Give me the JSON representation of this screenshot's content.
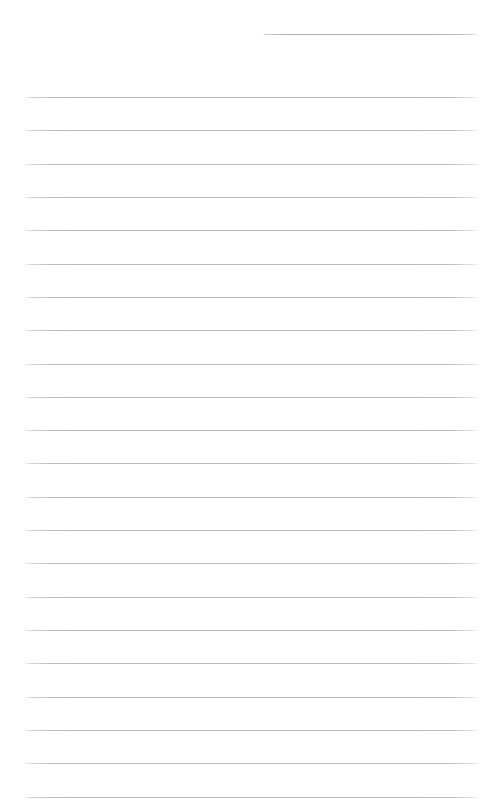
{
  "document": {
    "kind": "ruled-paper-sheet",
    "title": "",
    "body_text": "",
    "is_blank": true,
    "page_width": 502,
    "page_height": 808,
    "background_color": "#ffffff",
    "rule_color": "#b9b9bd",
    "header_rule_color": "#b2b2b7",
    "rule_thickness": 1,
    "rule_spacing": 33.3,
    "left_margin": 23,
    "right_margin": 479
  },
  "header_rule": {
    "name": "title-rule",
    "x": 262,
    "width": 216,
    "y": 34
  },
  "rules": [
    {
      "y": 97,
      "x": 23,
      "width": 456
    },
    {
      "y": 130,
      "x": 23,
      "width": 456
    },
    {
      "y": 164,
      "x": 23,
      "width": 456
    },
    {
      "y": 197,
      "x": 23,
      "width": 456
    },
    {
      "y": 230,
      "x": 23,
      "width": 456
    },
    {
      "y": 264,
      "x": 23,
      "width": 456
    },
    {
      "y": 297,
      "x": 23,
      "width": 456
    },
    {
      "y": 330,
      "x": 23,
      "width": 456
    },
    {
      "y": 364,
      "x": 23,
      "width": 456
    },
    {
      "y": 397,
      "x": 23,
      "width": 456
    },
    {
      "y": 430,
      "x": 23,
      "width": 456
    },
    {
      "y": 463,
      "x": 23,
      "width": 456
    },
    {
      "y": 497,
      "x": 23,
      "width": 456
    },
    {
      "y": 530,
      "x": 23,
      "width": 456
    },
    {
      "y": 563,
      "x": 23,
      "width": 456
    },
    {
      "y": 597,
      "x": 23,
      "width": 456
    },
    {
      "y": 630,
      "x": 23,
      "width": 456
    },
    {
      "y": 663,
      "x": 23,
      "width": 456
    },
    {
      "y": 697,
      "x": 23,
      "width": 456
    },
    {
      "y": 730,
      "x": 23,
      "width": 456
    },
    {
      "y": 763,
      "x": 23,
      "width": 456
    },
    {
      "y": 797,
      "x": 23,
      "width": 456
    }
  ],
  "line_entries": [
    {
      "index": 1,
      "text": ""
    },
    {
      "index": 2,
      "text": ""
    },
    {
      "index": 3,
      "text": ""
    },
    {
      "index": 4,
      "text": ""
    },
    {
      "index": 5,
      "text": ""
    },
    {
      "index": 6,
      "text": ""
    },
    {
      "index": 7,
      "text": ""
    },
    {
      "index": 8,
      "text": ""
    },
    {
      "index": 9,
      "text": ""
    },
    {
      "index": 10,
      "text": ""
    },
    {
      "index": 11,
      "text": ""
    },
    {
      "index": 12,
      "text": ""
    },
    {
      "index": 13,
      "text": ""
    },
    {
      "index": 14,
      "text": ""
    },
    {
      "index": 15,
      "text": ""
    },
    {
      "index": 16,
      "text": ""
    },
    {
      "index": 17,
      "text": ""
    },
    {
      "index": 18,
      "text": ""
    },
    {
      "index": 19,
      "text": ""
    },
    {
      "index": 20,
      "text": ""
    },
    {
      "index": 21,
      "text": ""
    },
    {
      "index": 22,
      "text": ""
    }
  ]
}
